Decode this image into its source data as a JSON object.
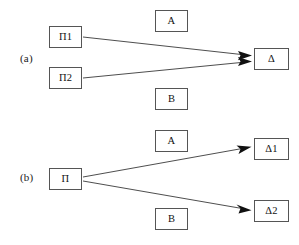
{
  "figure": {
    "background_color": "#ffffff",
    "line_color": "#3a3a3a",
    "box_border_color": "#555555",
    "text_color": "#111111"
  },
  "panels": [
    {
      "id": "a",
      "label": "(a)",
      "description": "two sources converge to one target",
      "source_nodes": [
        {
          "id": "pi1",
          "label": "Π1",
          "x": 49,
          "y": 26,
          "w": 33,
          "h": 22
        },
        {
          "id": "pi2",
          "label": "Π2",
          "x": 49,
          "y": 67,
          "w": 33,
          "h": 22
        }
      ],
      "middle_nodes": [
        {
          "id": "a-top",
          "label": "A",
          "x": 155,
          "y": 10,
          "w": 33,
          "h": 22
        },
        {
          "id": "b-bottom",
          "label": "B",
          "x": 155,
          "y": 88,
          "w": 33,
          "h": 22
        }
      ],
      "target_nodes": [
        {
          "id": "delta",
          "label": "Δ",
          "x": 254,
          "y": 48,
          "w": 35,
          "h": 22
        }
      ],
      "edges": [
        {
          "id": "pi1-to-delta",
          "from": "pi1",
          "to": "delta",
          "x1": 83,
          "y1": 37,
          "x2": 251,
          "y2": 55
        },
        {
          "id": "pi2-to-delta",
          "from": "pi2",
          "to": "delta",
          "x1": 83,
          "y1": 78,
          "x2": 251,
          "y2": 62
        }
      ]
    },
    {
      "id": "b",
      "label": "(b)",
      "description": "one source diverges to two targets",
      "source_nodes": [
        {
          "id": "pi",
          "label": "Π",
          "x": 49,
          "y": 46,
          "w": 33,
          "h": 22
        }
      ],
      "middle_nodes": [
        {
          "id": "a-top",
          "label": "A",
          "x": 155,
          "y": 8,
          "w": 33,
          "h": 22
        },
        {
          "id": "b-bottom",
          "label": "B",
          "x": 155,
          "y": 86,
          "w": 33,
          "h": 22
        }
      ],
      "target_nodes": [
        {
          "id": "delta1",
          "label": "Δ1",
          "x": 254,
          "y": 16,
          "w": 35,
          "h": 22
        },
        {
          "id": "delta2",
          "label": "Δ2",
          "x": 254,
          "y": 78,
          "w": 35,
          "h": 22
        }
      ],
      "edges": [
        {
          "id": "pi-to-delta1",
          "from": "pi",
          "to": "delta1",
          "x1": 83,
          "y1": 55,
          "x2": 251,
          "y2": 25
        },
        {
          "id": "pi-to-delta2",
          "from": "pi",
          "to": "delta2",
          "x1": 83,
          "y1": 59,
          "x2": 251,
          "y2": 88
        }
      ]
    }
  ]
}
